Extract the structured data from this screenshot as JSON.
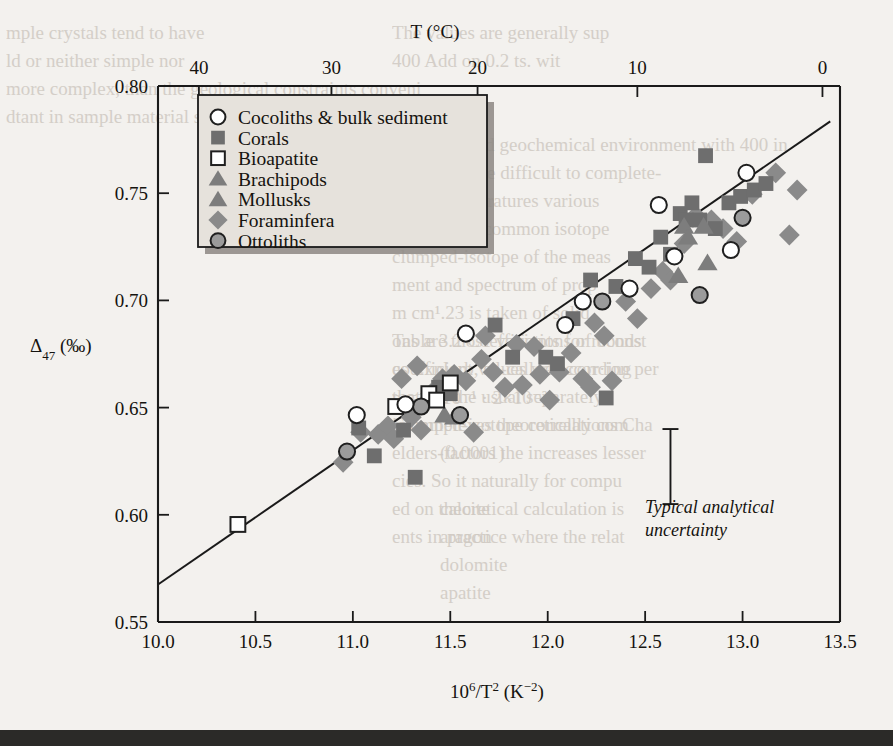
{
  "figure": {
    "top_axis_title": "T (°C)",
    "x_axis_title": "10⁶/T² (K⁻²)",
    "y_axis_title_main": "Δ",
    "y_axis_title_sub": "47",
    "y_axis_title_unit": " (‰)",
    "uncertainty_note_line1": "Typical analytical",
    "uncertainty_note_line2": "uncertainty"
  },
  "legend": {
    "items": [
      {
        "label": "Cocoliths & bulk sediment",
        "marker": "open-circle",
        "color": "#ffffff"
      },
      {
        "label": "Corals",
        "marker": "filled-square",
        "color": "#6f6f6f"
      },
      {
        "label": "Bioapatite",
        "marker": "open-square",
        "color": "#ffffff"
      },
      {
        "label": "Brachipods",
        "marker": "filled-triangle",
        "color": "#7d7d7d"
      },
      {
        "label": "Mollusks",
        "marker": "filled-triangle",
        "color": "#7d7d7d"
      },
      {
        "label": "Foraminfera",
        "marker": "filled-diamond",
        "color": "#8a8a8a"
      },
      {
        "label": "Ottoliths",
        "marker": "gray-circle",
        "color": "#9a9a9a"
      }
    ]
  },
  "chart_data": {
    "type": "scatter",
    "title": "",
    "xlabel": "10⁶/T² (K⁻²)",
    "ylabel": "Δ₄₇ (‰)",
    "xlim": [
      10.0,
      13.5
    ],
    "ylim": [
      0.55,
      0.8
    ],
    "grid": false,
    "legend_position": "top-left",
    "xticks": [
      10.0,
      10.5,
      11.0,
      11.5,
      12.0,
      12.5,
      13.0,
      13.5
    ],
    "xticklabels": [
      "10.0",
      "10.5",
      "11.0",
      "11.5",
      "12.0",
      "12.5",
      "13.0",
      "13.5"
    ],
    "yticks": [
      0.55,
      0.6,
      0.65,
      0.7,
      0.75,
      0.8
    ],
    "yticklabels": [
      "0.55",
      "0.60",
      "0.65",
      "0.70",
      "0.75",
      "0.80"
    ],
    "secondary_axis": {
      "label": "T (°C)",
      "position": "top",
      "ticks_celsius": [
        40,
        30,
        20,
        10,
        0
      ],
      "ticklabels": [
        "40",
        "30",
        "20",
        "10",
        "0"
      ],
      "tick_x_values": [
        10.21,
        10.89,
        11.64,
        12.46,
        13.41
      ]
    },
    "fit_line": {
      "x": [
        10.0,
        13.45
      ],
      "y": [
        0.5675,
        0.7835
      ]
    },
    "error_bar": {
      "x": 12.63,
      "y_center": 0.6225,
      "half_height": 0.0175
    },
    "series": [
      {
        "name": "Cocoliths & bulk sediment",
        "marker": "open-circle",
        "points": [
          [
            11.02,
            0.6465
          ],
          [
            11.58,
            0.6845
          ],
          [
            12.09,
            0.6885
          ],
          [
            12.18,
            0.6995
          ],
          [
            12.42,
            0.7055
          ],
          [
            12.57,
            0.7445
          ],
          [
            12.65,
            0.7205
          ],
          [
            12.94,
            0.7235
          ],
          [
            13.02,
            0.7595
          ],
          [
            11.27,
            0.6515
          ]
        ]
      },
      {
        "name": "Corals",
        "marker": "filled-square",
        "points": [
          [
            11.03,
            0.6405
          ],
          [
            11.11,
            0.6275
          ],
          [
            11.26,
            0.6395
          ],
          [
            11.32,
            0.6175
          ],
          [
            11.44,
            0.6595
          ],
          [
            11.73,
            0.6885
          ],
          [
            11.82,
            0.6735
          ],
          [
            11.99,
            0.6735
          ],
          [
            12.05,
            0.6705
          ],
          [
            12.13,
            0.6915
          ],
          [
            12.22,
            0.7095
          ],
          [
            12.35,
            0.7065
          ],
          [
            12.45,
            0.7195
          ],
          [
            12.58,
            0.7295
          ],
          [
            12.63,
            0.7215
          ],
          [
            12.68,
            0.7405
          ],
          [
            12.71,
            0.7375
          ],
          [
            12.74,
            0.7455
          ],
          [
            12.78,
            0.7375
          ],
          [
            12.81,
            0.7675
          ],
          [
            12.86,
            0.7335
          ],
          [
            12.93,
            0.7455
          ],
          [
            12.99,
            0.7485
          ],
          [
            13.06,
            0.7515
          ],
          [
            13.12,
            0.7545
          ],
          [
            12.52,
            0.7155
          ],
          [
            12.3,
            0.6545
          ],
          [
            11.5,
            0.6565
          ]
        ]
      },
      {
        "name": "Bioapatite",
        "marker": "open-square",
        "points": [
          [
            10.41,
            0.5955
          ],
          [
            11.22,
            0.6505
          ],
          [
            11.39,
            0.6565
          ],
          [
            11.5,
            0.6615
          ],
          [
            11.43,
            0.6535
          ]
        ]
      },
      {
        "name": "Brachipods",
        "marker": "filled-triangle",
        "points": [
          [
            11.47,
            0.6465
          ],
          [
            12.67,
            0.7115
          ],
          [
            12.82,
            0.7175
          ],
          [
            12.7,
            0.7345
          ]
        ]
      },
      {
        "name": "Mollusks",
        "marker": "filled-triangle",
        "points": [
          [
            12.72,
            0.7295
          ],
          [
            12.8,
            0.7345
          ],
          [
            11.52,
            0.6455
          ]
        ]
      },
      {
        "name": "Foraminfera",
        "marker": "filled-diamond",
        "points": [
          [
            10.95,
            0.6245
          ],
          [
            11.04,
            0.6385
          ],
          [
            11.13,
            0.6375
          ],
          [
            11.18,
            0.6415
          ],
          [
            11.21,
            0.6355
          ],
          [
            11.3,
            0.6455
          ],
          [
            11.35,
            0.6395
          ],
          [
            11.4,
            0.6565
          ],
          [
            11.46,
            0.6635
          ],
          [
            11.52,
            0.6655
          ],
          [
            11.58,
            0.6625
          ],
          [
            11.62,
            0.6385
          ],
          [
            11.66,
            0.6725
          ],
          [
            11.72,
            0.6665
          ],
          [
            11.78,
            0.6595
          ],
          [
            11.84,
            0.6795
          ],
          [
            11.87,
            0.6605
          ],
          [
            11.93,
            0.6785
          ],
          [
            11.96,
            0.6655
          ],
          [
            12.01,
            0.6535
          ],
          [
            12.06,
            0.6665
          ],
          [
            12.12,
            0.6755
          ],
          [
            12.18,
            0.6635
          ],
          [
            12.24,
            0.6895
          ],
          [
            12.29,
            0.6835
          ],
          [
            12.33,
            0.6625
          ],
          [
            12.4,
            0.6995
          ],
          [
            12.46,
            0.6915
          ],
          [
            12.53,
            0.7055
          ],
          [
            12.59,
            0.7135
          ],
          [
            12.63,
            0.7095
          ],
          [
            12.7,
            0.7265
          ],
          [
            12.76,
            0.7395
          ],
          [
            12.84,
            0.7375
          ],
          [
            12.9,
            0.7335
          ],
          [
            12.97,
            0.7275
          ],
          [
            13.05,
            0.7495
          ],
          [
            13.17,
            0.7595
          ],
          [
            13.24,
            0.7305
          ],
          [
            13.28,
            0.7515
          ],
          [
            11.68,
            0.6835
          ],
          [
            12.22,
            0.6595
          ],
          [
            11.25,
            0.6635
          ],
          [
            11.33,
            0.6695
          ]
        ]
      },
      {
        "name": "Ottoliths",
        "marker": "gray-circle",
        "points": [
          [
            10.97,
            0.6295
          ],
          [
            11.35,
            0.6505
          ],
          [
            11.55,
            0.6465
          ],
          [
            12.28,
            0.6995
          ],
          [
            12.78,
            0.7025
          ],
          [
            13.0,
            0.7385
          ]
        ]
      }
    ]
  },
  "ghost_text": [
    {
      "t": "mple crystals tend to have",
      "x": 6,
      "y": 22,
      "flip": false
    },
    {
      "t": "The values are generally sup",
      "x": 392,
      "y": 22,
      "flip": false
    },
    {
      "t": "ld or neither simple nor",
      "x": 6,
      "y": 50,
      "flip": false
    },
    {
      "t": "400 Add on 0.2 ts. wit",
      "x": 392,
      "y": 50,
      "flip": false
    },
    {
      "t": "more complex, than the geological constraints conveni",
      "x": 6,
      "y": 78,
      "flip": false
    },
    {
      "t": "dtant in sample material such as clustered isotopes between",
      "x": 6,
      "y": 106,
      "flip": false
    },
    {
      "t": "The so-called geochemical environment with 400 in",
      "x": 392,
      "y": 134,
      "flip": false
    },
    {
      "t": "ures are more difficult to complete-",
      "x": 392,
      "y": 162,
      "flip": false
    },
    {
      "t": "ate so temperatures various",
      "x": 392,
      "y": 190,
      "flip": false
    },
    {
      "t": "ure 3.3 as a common isotope",
      "x": 392,
      "y": 218,
      "flip": false
    },
    {
      "t": "clumped-isotope of the meas",
      "x": 392,
      "y": 246,
      "flip": false
    },
    {
      "t": "ment and spectrum of prop",
      "x": 392,
      "y": 274,
      "flip": false
    },
    {
      "t": "m cm¹.23 is taken of solid",
      "x": 392,
      "y": 302,
      "flip": false
    },
    {
      "t": "ons are those variations of bonds",
      "x": 392,
      "y": 330,
      "flip": false
    },
    {
      "t": "es Explorb, so-called according",
      "x": 392,
      "y": 358,
      "flip": false
    },
    {
      "t": "that are the usual separately",
      "x": 392,
      "y": 386,
      "flip": false
    },
    {
      "t": "ic complexes theoretically com",
      "x": 392,
      "y": 414,
      "flip": false
    },
    {
      "t": "elders-factors the increases lesser",
      "x": 392,
      "y": 442,
      "flip": false
    },
    {
      "t": "cies. So it naturally for compu",
      "x": 392,
      "y": 470,
      "flip": false
    },
    {
      "t": "ed on theoretical calculation is",
      "x": 392,
      "y": 498,
      "flip": false
    },
    {
      "t": "ents in practice where the relat",
      "x": 392,
      "y": 526,
      "flip": false
    },
    {
      "t": "Table 3.2   Coefficients for reconst",
      "x": 392,
      "y": 330,
      "flip": false
    },
    {
      "t": "coefficient values well corr·ion per",
      "x": 392,
      "y": 358,
      "flip": false
    },
    {
      "t": "p = 4×10⁻¹ · 2×10⁻²",
      "x": 392,
      "y": 386,
      "flip": false
    },
    {
      "t": "Clumped-isotope correlations Cha",
      "x": 392,
      "y": 414,
      "flip": false
    },
    {
      "t": "(0.0001)",
      "x": 440,
      "y": 442,
      "flip": false
    },
    {
      "t": "calcite",
      "x": 440,
      "y": 498,
      "flip": false
    },
    {
      "t": "aragon",
      "x": 440,
      "y": 526,
      "flip": false
    },
    {
      "t": "dolomite",
      "x": 440,
      "y": 554,
      "flip": false
    },
    {
      "t": "apatite",
      "x": 440,
      "y": 582,
      "flip": false
    }
  ]
}
